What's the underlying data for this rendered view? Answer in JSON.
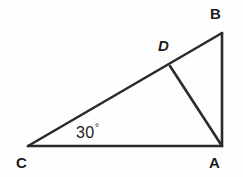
{
  "figure": {
    "type": "geometry-diagram",
    "shape": "triangle",
    "background_color": "#fefefe",
    "stroke_color": "#2b2b2b",
    "text_color": "#1c1c1c",
    "stroke_width": 2.6,
    "width": 243,
    "height": 177
  },
  "labels": {
    "vertex_a": "A",
    "vertex_b": "B",
    "vertex_c": "C",
    "vertex_d": "D",
    "angle_c": "30",
    "degree_symbol": "°"
  },
  "geometry": {
    "points": {
      "A": {
        "x": 222,
        "y": 146
      },
      "B": {
        "x": 222,
        "y": 33
      },
      "C": {
        "x": 28,
        "y": 146
      },
      "D": {
        "x": 170,
        "y": 66
      }
    },
    "segments": [
      {
        "name": "CA",
        "from": "C",
        "to": "A"
      },
      {
        "name": "CB",
        "from": "C",
        "to": "B"
      },
      {
        "name": "AB",
        "from": "A",
        "to": "B"
      },
      {
        "name": "DA",
        "from": "D",
        "to": "A"
      }
    ],
    "angles": [
      {
        "at": "C",
        "value": 30,
        "unit": "degrees",
        "label": "30°"
      }
    ]
  }
}
